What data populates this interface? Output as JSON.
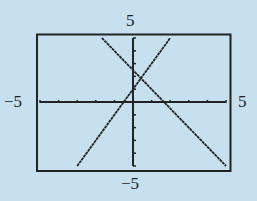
{
  "chart_data": {
    "type": "line",
    "title": "",
    "xlabel": "",
    "ylabel": "",
    "xlim": [
      -5,
      5
    ],
    "ylim": [
      -5,
      5
    ],
    "grid": false,
    "xscale": 1,
    "yscale": 1,
    "window_labels": {
      "xmin": "−5",
      "xmax": "5",
      "ymin": "−5",
      "ymax": "5"
    },
    "series": [
      {
        "name": "rising line",
        "equation": "y = 2x + 1",
        "slope": 2,
        "intercept": 1,
        "x": [
          -3,
          2
        ],
        "y": [
          -5,
          5
        ]
      },
      {
        "name": "falling line",
        "equation": "y = -1.5x + 2.5",
        "slope": -1.5,
        "intercept": 2.5,
        "x": [
          -1.67,
          5
        ],
        "y": [
          5,
          -5
        ]
      }
    ],
    "intersection": {
      "x": 0.43,
      "y": 1.86
    }
  },
  "colors": {
    "background": "#c6e0ef",
    "ink": "#222222"
  }
}
